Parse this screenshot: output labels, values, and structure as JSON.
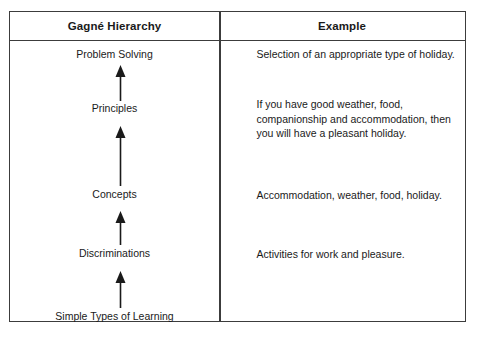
{
  "table": {
    "headers": {
      "hierarchy": "Gagné Hierarchy",
      "example": "Example"
    },
    "rows": [
      {
        "level": "Problem Solving",
        "example": "Selection of an appropriate type of holiday."
      },
      {
        "level": "Principles",
        "example": "If you have good weather, food, companionship and accommodation, then you will have a pleasant holiday."
      },
      {
        "level": "Concepts",
        "example": "Accommodation, weather, food, holiday."
      },
      {
        "level": "Discriminations",
        "example": "Activities for work and pleasure."
      },
      {
        "level": "Simple Types of Learning",
        "example": ""
      }
    ],
    "arrows": [
      "up-arrow-discriminations-to-concepts",
      "up-arrow-concepts-to-principles",
      "up-arrow-principles-to-problem-solving"
    ],
    "colors": {
      "border": "#3c3c3c",
      "text": "#1a1a1a",
      "background": "#ffffff",
      "arrow": "#1a1a1a"
    }
  }
}
